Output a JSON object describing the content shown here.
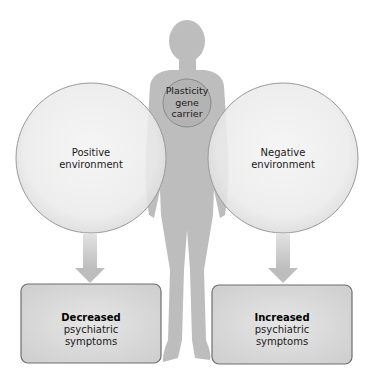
{
  "diagram": {
    "center": {
      "figure": "human-silhouette",
      "label_lines": [
        "Plasticity",
        "gene",
        "carrier"
      ]
    },
    "left_environment": {
      "label_lines": [
        "Positive",
        "environment"
      ],
      "outcome": {
        "bold": "Decreased",
        "lines": [
          "psychiatric",
          "symptoms"
        ]
      }
    },
    "right_environment": {
      "label_lines": [
        "Negative",
        "environment"
      ],
      "outcome": {
        "bold": "Increased",
        "lines": [
          "psychiatric",
          "symptoms"
        ]
      }
    },
    "colors": {
      "silhouette": "#bdbdbd",
      "gene_circle_fill": "#b0b0b0",
      "gene_circle_stroke": "#8a8a8a",
      "env_circle_fill": "#ececec",
      "env_circle_stroke": "#9a9a9a",
      "arrow": "#c4c4c4",
      "box_fill": "#d6d6d6",
      "box_stroke": "#6e6e6e"
    }
  }
}
